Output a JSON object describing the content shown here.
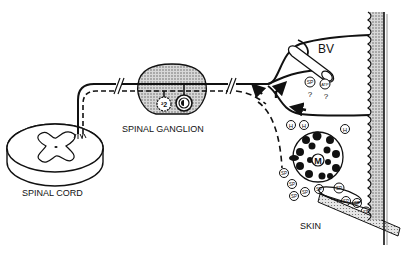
{
  "labels": {
    "spinal_cord": "SPINAL CORD",
    "spinal_ganglion": "SPINAL GANGLION",
    "blood_vessel": "BV",
    "skin": "SKIN"
  },
  "markers": {
    "neuron_2": "²2",
    "neuron_1": "·1",
    "substance_p": "SP",
    "atp": "ATP",
    "histamine": "H",
    "mast_cell": "M",
    "question": "?"
  },
  "colors": {
    "line": "#111111",
    "stipple": "#9a9a9a",
    "background": "#ffffff"
  }
}
